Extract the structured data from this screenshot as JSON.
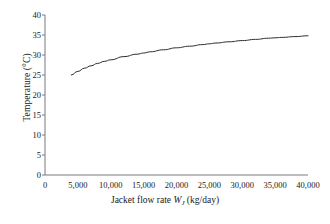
{
  "chart_data": {
    "type": "line",
    "title": "",
    "subtitle": "",
    "xlabel_full": "Jacket flow rate WJ (kg/day)",
    "xlabel_prefix": "Jacket flow rate ",
    "xlabel_symbol": "W",
    "xlabel_subscript": "J",
    "xlabel_units": " (kg/day)",
    "ylabel": "Temperature (°C)",
    "xlim": [
      0,
      40000
    ],
    "ylim": [
      0,
      40
    ],
    "xticks": [
      0,
      5000,
      10000,
      15000,
      20000,
      25000,
      30000,
      35000,
      40000
    ],
    "xtick_labels": [
      "0",
      "5,000",
      "10,000",
      "15,000",
      "20,000",
      "25,000",
      "30,000",
      "35,000",
      "40,000"
    ],
    "yticks": [
      0,
      5,
      10,
      15,
      20,
      25,
      30,
      35,
      40
    ],
    "ytick_labels": [
      "0",
      "5",
      "10",
      "15",
      "20",
      "25",
      "30",
      "35",
      "40"
    ],
    "grid": false,
    "legend": false,
    "legend_position": "none",
    "line_color": "#2b2b2b",
    "line_width": 1.0,
    "axis_color": "#7a7a7a",
    "background_color": "#ffffff",
    "series": [
      {
        "name": "Outlet temperature vs jacket flow rate",
        "x": [
          4000,
          5000,
          6000,
          7000,
          8000,
          9000,
          10000,
          12000,
          14000,
          15000,
          16000,
          18000,
          20000,
          22000,
          24000,
          25000,
          26000,
          28000,
          30000,
          32000,
          34000,
          35000,
          36000,
          38000,
          40000
        ],
        "y": [
          25.0,
          25.9,
          26.7,
          27.3,
          27.9,
          28.4,
          28.8,
          29.6,
          30.2,
          30.5,
          30.8,
          31.3,
          31.8,
          32.2,
          32.6,
          32.8,
          33.0,
          33.3,
          33.6,
          33.9,
          34.2,
          34.3,
          34.4,
          34.6,
          34.8
        ]
      }
    ],
    "annotations": []
  },
  "figure": {
    "name": "jacket-flow-rate-temperature-plot"
  }
}
